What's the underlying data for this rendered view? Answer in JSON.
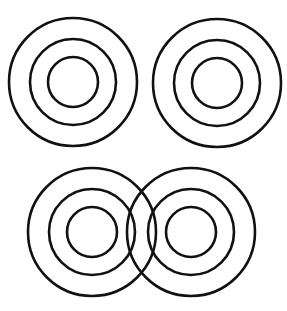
{
  "canvas": {
    "width": 287,
    "height": 311,
    "background": "#ffffff"
  },
  "style": {
    "stroke": "#111111",
    "stroke_width": 2.6,
    "fill": "none"
  },
  "ring_radii": [
    25,
    43,
    64
  ],
  "targets": [
    {
      "id": "top-left",
      "cx": 73,
      "cy": 82
    },
    {
      "id": "top-right",
      "cx": 217,
      "cy": 83
    },
    {
      "id": "bottom-left",
      "cx": 92,
      "cy": 232
    },
    {
      "id": "bottom-right",
      "cx": 191,
      "cy": 232
    }
  ]
}
